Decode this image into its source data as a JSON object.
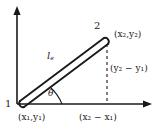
{
  "figure": {
    "type": "bar-element-diagram",
    "background_color": "#ffffff",
    "ink_color": "#1a1a1a",
    "axes": {
      "origin_label": "",
      "vertical_axis_name": "y-axis",
      "horizontal_axis_name": "x-axis",
      "arrowheads": "both"
    },
    "nodes": [
      {
        "id": "node-1",
        "number": "1",
        "coordinate_label": "(x₁,y₁)"
      },
      {
        "id": "node-2",
        "number": "2",
        "coordinate_label": "(x₂,y₂)"
      }
    ],
    "member": {
      "label": "l",
      "label_subscript": "e",
      "style": "double-line-bar"
    },
    "angle": {
      "label": "θ",
      "arc": true
    },
    "projections": {
      "vertical_label": "(y₂ − y₁)",
      "horizontal_label": "(x₂ − x₁)",
      "line_style": "dashed"
    }
  }
}
